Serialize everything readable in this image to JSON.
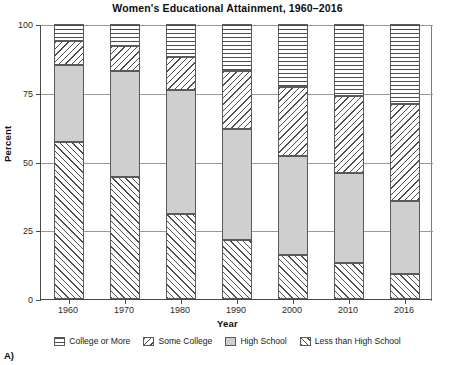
{
  "panel_label": "A)",
  "chart_data": {
    "type": "bar",
    "subtype": "stacked-bar-100",
    "title": "Women's Educational Attainment, 1960–2016",
    "xlabel": "Year",
    "ylabel": "Percent",
    "ylim": [
      0,
      100
    ],
    "yticks": [
      0,
      25,
      50,
      75,
      100
    ],
    "ytick_labels": [
      "0",
      "25",
      "50",
      "75",
      "100"
    ],
    "grid": true,
    "grid_axis": "y",
    "legend_position": "bottom",
    "categories": [
      "1960",
      "1970",
      "1980",
      "1990",
      "2000",
      "2010",
      "2016"
    ],
    "series": [
      {
        "name": "Less than High School",
        "pattern": "forward-diagonal",
        "color": "#ffffff",
        "values": [
          57,
          44.5,
          31,
          21.5,
          16,
          13,
          9
        ]
      },
      {
        "name": "High School",
        "pattern": "solid-gray",
        "color": "#cfcfcf",
        "values": [
          28,
          38.5,
          45,
          40.5,
          36,
          33,
          26.5
        ]
      },
      {
        "name": "Some College",
        "pattern": "back-diagonal",
        "color": "#ffffff",
        "values": [
          9,
          9,
          12,
          21,
          25,
          28,
          35.5
        ]
      },
      {
        "name": "College or More",
        "pattern": "horizontal-lines",
        "color": "#ffffff",
        "values": [
          6,
          8,
          12,
          17,
          23,
          26,
          29
        ]
      }
    ],
    "stack_tops": {
      "1960": {
        "less_than_hs": 57,
        "high_school": 85,
        "some_college": 94,
        "college_or_more": 100
      },
      "1970": {
        "less_than_hs": 44.5,
        "high_school": 83,
        "some_college": 92,
        "college_or_more": 100
      },
      "1980": {
        "less_than_hs": 31,
        "high_school": 76,
        "some_college": 88,
        "college_or_more": 100
      },
      "1990": {
        "less_than_hs": 21.5,
        "high_school": 62,
        "some_college": 83,
        "college_or_more": 100
      },
      "2000": {
        "less_than_hs": 16,
        "high_school": 52,
        "some_college": 77,
        "college_or_more": 100
      },
      "2010": {
        "less_than_hs": 13,
        "high_school": 46,
        "some_college": 74,
        "college_or_more": 100
      },
      "2016": {
        "less_than_hs": 9,
        "high_school": 35.5,
        "some_college": 71,
        "college_or_more": 100
      }
    }
  },
  "legend": {
    "items": [
      {
        "label": "College or More",
        "pattern": "horizontal-lines"
      },
      {
        "label": "Some College",
        "pattern": "back-diagonal"
      },
      {
        "label": "High School",
        "pattern": "solid-gray"
      },
      {
        "label": "Less than High School",
        "pattern": "forward-diagonal"
      }
    ]
  }
}
